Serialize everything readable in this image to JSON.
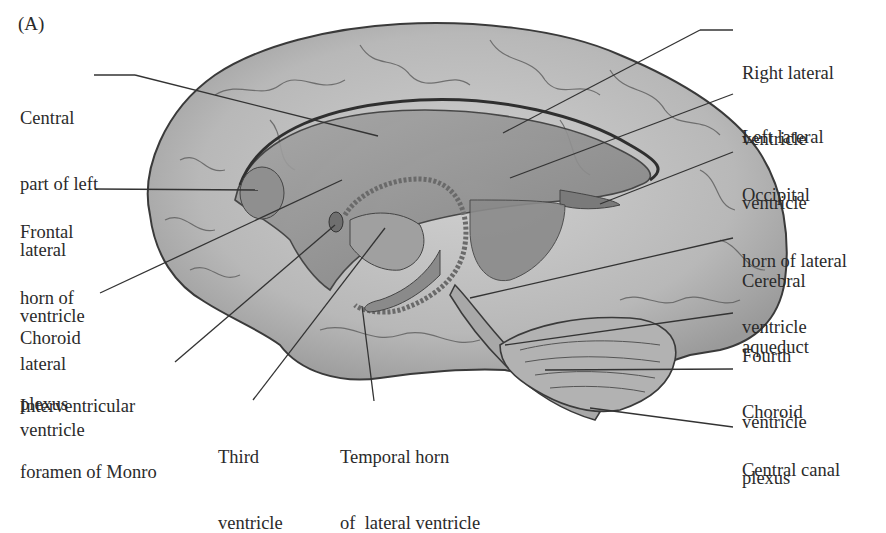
{
  "figure": {
    "panel_label": "(A)",
    "colors": {
      "background": "#ffffff",
      "brain_fill": "#bdbdbd",
      "ventricle_fill": "#8a8a8a",
      "outline": "#3a3a3a",
      "text": "#2a2a2a"
    }
  },
  "labels": {
    "central_part": {
      "lines": [
        "Central",
        "part of left",
        "lateral",
        "ventricle"
      ]
    },
    "frontal_horn": {
      "lines": [
        "Frontal",
        "horn of",
        "lateral",
        "ventricle"
      ]
    },
    "choroid_plexus_left": {
      "lines": [
        "Choroid",
        "plexus"
      ]
    },
    "interventricular": {
      "lines": [
        "Interventricular",
        "foramen of Monro"
      ]
    },
    "third_ventricle": {
      "lines": [
        "Third",
        "ventricle"
      ]
    },
    "temporal_horn": {
      "lines": [
        "Temporal horn",
        "of  lateral ventricle"
      ]
    },
    "right_lateral": {
      "lines": [
        "Right lateral",
        "ventricle"
      ]
    },
    "left_lateral": {
      "lines": [
        "Left lateral",
        "ventricle"
      ]
    },
    "occipital_horn": {
      "lines": [
        "Occipital",
        "horn of lateral",
        "ventricle"
      ]
    },
    "cerebral_aqueduct": {
      "lines": [
        "Cerebral",
        "aqueduct"
      ]
    },
    "fourth_ventricle": {
      "lines": [
        "Fourth",
        "ventricle"
      ]
    },
    "choroid_plexus_right": {
      "lines": [
        "Choroid",
        "plexus"
      ]
    },
    "central_canal": {
      "lines": [
        "Central canal"
      ]
    }
  }
}
